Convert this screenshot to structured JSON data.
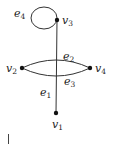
{
  "graph": {
    "vertices": [
      {
        "id": "v1",
        "name": "v",
        "sub": "1",
        "x": 56,
        "y": 113
      },
      {
        "id": "v2",
        "name": "v",
        "sub": "2",
        "x": 22,
        "y": 68
      },
      {
        "id": "v3",
        "name": "v",
        "sub": "3",
        "x": 57,
        "y": 20
      },
      {
        "id": "v4",
        "name": "v",
        "sub": "4",
        "x": 90,
        "y": 68
      }
    ],
    "edges": [
      {
        "id": "e1",
        "name": "e",
        "sub": "1",
        "from": "v3",
        "to": "v1"
      },
      {
        "id": "e2",
        "name": "e",
        "sub": "2",
        "from": "v2",
        "to": "v4"
      },
      {
        "id": "e3",
        "name": "e",
        "sub": "3",
        "from": "v2",
        "to": "v4"
      },
      {
        "id": "e4",
        "name": "e",
        "sub": "4",
        "from": "v3",
        "to": "v3"
      }
    ],
    "labels": {
      "v1": {
        "base": "v",
        "sub": "1"
      },
      "v2": {
        "base": "v",
        "sub": "2"
      },
      "v3": {
        "base": "v",
        "sub": "3"
      },
      "v4": {
        "base": "v",
        "sub": "4"
      },
      "e1": {
        "base": "e",
        "sub": "1"
      },
      "e2": {
        "base": "e",
        "sub": "2"
      },
      "e3": {
        "base": "e",
        "sub": "3"
      },
      "e4": {
        "base": "e",
        "sub": "4"
      }
    }
  }
}
